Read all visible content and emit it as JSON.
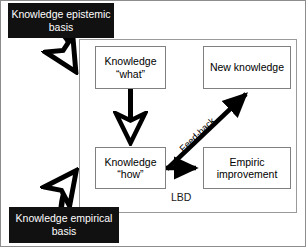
{
  "diagram": {
    "title_label": "LBD",
    "frame": {
      "name": "LBD",
      "x": 78,
      "y": 38,
      "w": 218,
      "h": 174
    },
    "nodes": [
      {
        "id": "knowledge-what",
        "line1": "Knowledge",
        "line2": "“what”",
        "x": 94,
        "y": 45,
        "w": 71,
        "h": 43,
        "fill": "#ffffff",
        "stroke": "#808080",
        "text_color": "#000000"
      },
      {
        "id": "new-knowledge",
        "line1": "New knowledge",
        "line2": "",
        "x": 202,
        "y": 45,
        "w": 88,
        "h": 43,
        "fill": "#ffffff",
        "stroke": "#808080",
        "text_color": "#000000"
      },
      {
        "id": "knowledge-how",
        "line1": "Knowledge",
        "line2": "“how”",
        "x": 94,
        "y": 146,
        "w": 71,
        "h": 42,
        "fill": "#ffffff",
        "stroke": "#808080",
        "text_color": "#000000"
      },
      {
        "id": "empiric-improvement",
        "line1": "Empiric",
        "line2": "improvement",
        "x": 202,
        "y": 146,
        "w": 88,
        "h": 42,
        "fill": "#ffffff",
        "stroke": "#808080",
        "text_color": "#000000"
      }
    ],
    "callouts": [
      {
        "id": "knowledge-epistemic-basis",
        "line1": "Knowledge",
        "line2": "epistemic basis",
        "x": 7,
        "y": 2,
        "w": 106,
        "h": 35,
        "fill": "#111111",
        "text_color": "#ffffff"
      },
      {
        "id": "knowledge-empirical-basis",
        "line1": "Knowledge",
        "line2": "empirical basis",
        "x": 8,
        "y": 206,
        "w": 110,
        "h": 36,
        "fill": "#111111",
        "text_color": "#ffffff"
      }
    ],
    "edges": [
      {
        "id": "epistemic-to-what",
        "label": "",
        "style": "thick-curved-hollow-arrow"
      },
      {
        "id": "empirical-to-how",
        "label": "",
        "style": "thick-curved-hollow-arrow"
      },
      {
        "id": "what-to-how",
        "label": "",
        "style": "thick-straight-hollow-arrow"
      },
      {
        "id": "how-to-empiric",
        "label": "",
        "style": "thick-straight-solid-arrow"
      },
      {
        "id": "how-to-new-knowledge",
        "label": "Feed-back",
        "style": "thick-diagonal-solid-arrow"
      }
    ]
  }
}
